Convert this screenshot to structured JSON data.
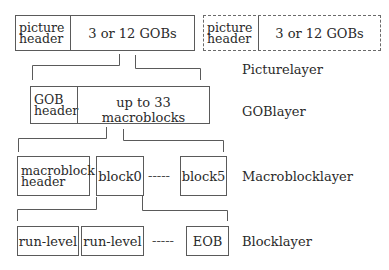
{
  "diagram": {
    "picture_layer": {
      "label": "Picturelayer",
      "boxes": [
        {
          "header": [
            "picture",
            "header"
          ],
          "content": "3 or 12 GOBs",
          "style": "solid"
        },
        {
          "header": [
            "picture",
            "header"
          ],
          "content": "3 or 12 GOBs",
          "style": "dashed"
        }
      ]
    },
    "gob_layer": {
      "label": "GOBlayer",
      "header": [
        "GOB",
        "header"
      ],
      "content": "up to 33 macroblocks"
    },
    "macroblock_layer": {
      "label": "Macroblocklayer",
      "header": [
        "macroblock",
        "header"
      ],
      "blocks": [
        "block0",
        "block5"
      ],
      "ellipsis": "-----"
    },
    "block_layer": {
      "label": "Blocklayer",
      "items": [
        "run-level",
        "run-level",
        "EOB"
      ],
      "ellipsis": "-----"
    }
  }
}
